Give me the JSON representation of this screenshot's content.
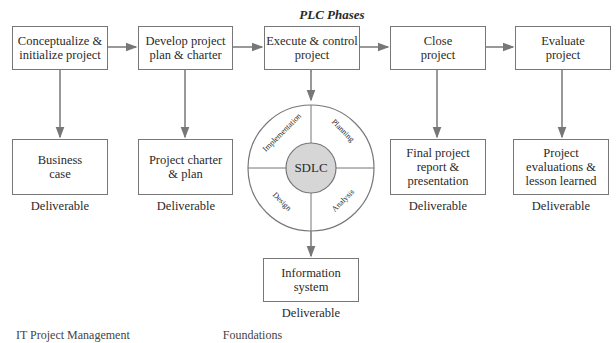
{
  "diagram": {
    "title": "PLC Phases",
    "phases": [
      {
        "line1": "Conceptualize &",
        "line2": "initialize project"
      },
      {
        "line1": "Develop project",
        "line2": "plan & charter"
      },
      {
        "line1": "Execute & control",
        "line2": "project"
      },
      {
        "line1": "Close",
        "line2": "project"
      },
      {
        "line1": "Evaluate",
        "line2": "project"
      }
    ],
    "deliverables": [
      {
        "lines": [
          "Business",
          "case"
        ],
        "label": "Deliverable"
      },
      {
        "lines": [
          "Project charter",
          "& plan"
        ],
        "label": "Deliverable"
      },
      {
        "lines": [
          "Information",
          "system"
        ],
        "label": "Deliverable"
      },
      {
        "lines": [
          "Final project",
          "report &",
          "presentation"
        ],
        "label": "Deliverable"
      },
      {
        "lines": [
          "Project",
          "evaluations &",
          "lesson learned"
        ],
        "label": "Deliverable"
      }
    ],
    "sdlc": {
      "center": "SDLC",
      "quadrants": [
        "Implementation",
        "Planning",
        "Design",
        "Analysis"
      ]
    },
    "footer": [
      "IT Project Management",
      "Foundations"
    ],
    "colors": {
      "line": "#777777",
      "sdlc_fill": "#d6d6d6"
    }
  }
}
